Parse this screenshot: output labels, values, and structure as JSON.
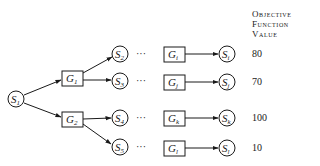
{
  "header": {
    "line1": "Objective",
    "line2": "Function",
    "line3": "Value"
  },
  "nodes": {
    "S1": {
      "base": "S",
      "sub": "1"
    },
    "G1": {
      "base": "G",
      "sub": "1"
    },
    "G2": {
      "base": "G",
      "sub": "2"
    },
    "S2": {
      "base": "S",
      "sub": "2"
    },
    "S3": {
      "base": "S",
      "sub": "3"
    },
    "S4": {
      "base": "S",
      "sub": "4"
    },
    "S5": {
      "base": "S",
      "sub": "5"
    },
    "Gi": {
      "base": "G",
      "sub": "i"
    },
    "Gj": {
      "base": "G",
      "sub": "j"
    },
    "Gk": {
      "base": "G",
      "sub": "k"
    },
    "Gl": {
      "base": "G",
      "sub": "l"
    },
    "Si": {
      "base": "S",
      "sub": "i"
    },
    "Sj": {
      "base": "S",
      "sub": "j"
    },
    "Sk": {
      "base": "S",
      "sub": "k"
    },
    "Sl": {
      "base": "S",
      "sub": "l"
    }
  },
  "ellipsis": "···",
  "values": [
    "80",
    "70",
    "100",
    "10"
  ]
}
